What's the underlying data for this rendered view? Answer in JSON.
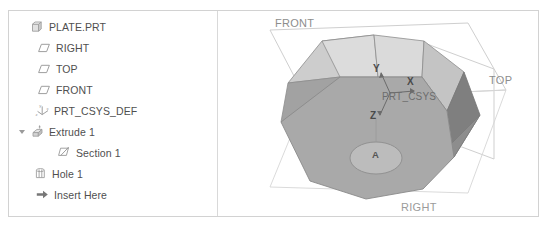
{
  "colors": {
    "frame_border": "#d2d2d2",
    "panel_divider": "#d9d9d9",
    "tree_text": "#4f4f4f",
    "icon_stroke": "#9e9e9e",
    "datum_outline": "#c9c9c9",
    "datum_label": "#8d8d8d",
    "face_top_light": "#d5d5d5",
    "face_top_lighter": "#dedede",
    "face_front": "#a8a8a8",
    "face_side_dark": "#8f8f8f",
    "face_side_darker": "#7e7e7e",
    "edge": "#8a8a8a",
    "hole": "#bdbdbd"
  },
  "tree": {
    "panel_name": "Model Tree",
    "items": [
      {
        "label": "PLATE.PRT",
        "icon": "part-icon",
        "indent": 0,
        "twisty": "none",
        "selected": false
      },
      {
        "label": "RIGHT",
        "icon": "datum-plane-icon",
        "indent": 1,
        "twisty": "none",
        "selected": false
      },
      {
        "label": "TOP",
        "icon": "datum-plane-icon",
        "indent": 1,
        "twisty": "none",
        "selected": false
      },
      {
        "label": "FRONT",
        "icon": "datum-plane-icon",
        "indent": 1,
        "twisty": "none",
        "selected": false
      },
      {
        "label": "PRT_CSYS_DEF",
        "icon": "csys-icon",
        "indent": 1,
        "twisty": "none",
        "selected": false
      },
      {
        "label": "Extrude 1",
        "icon": "extrude-icon",
        "indent": 1,
        "twisty": "open",
        "selected": false
      },
      {
        "label": "Section 1",
        "icon": "sketch-icon",
        "indent": 2,
        "twisty": "none",
        "selected": false
      },
      {
        "label": "Hole 1",
        "icon": "hole-icon",
        "indent": 1,
        "twisty": "none",
        "selected": false
      },
      {
        "label": "Insert Here",
        "icon": "insert-arrow-icon",
        "indent": 1,
        "twisty": "none",
        "selected": false
      }
    ]
  },
  "viewport": {
    "name": "graphics-area",
    "datum_labels": [
      {
        "text": "FRONT",
        "x": 57,
        "y": 6
      },
      {
        "text": "TOP",
        "x": 271,
        "y": 66
      },
      {
        "text": "RIGHT",
        "x": 183,
        "y": 199
      }
    ],
    "csys": {
      "name": "PRT_CSYS",
      "axes": [
        {
          "text": "Y",
          "x": 157,
          "y": 60
        },
        {
          "text": "X",
          "x": 191,
          "y": 71
        },
        {
          "text": "Z",
          "x": 154,
          "y": 103
        }
      ]
    },
    "axis_label": {
      "text": "A",
      "x": 159,
      "y": 141
    }
  }
}
